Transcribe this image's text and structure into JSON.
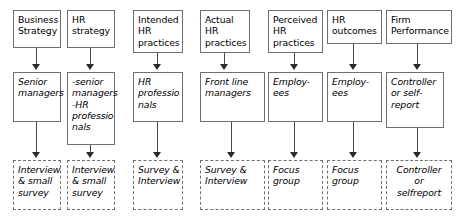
{
  "diagram": {
    "columns": [
      {
        "id": "business-strategy",
        "concept": "Business\nStrategy",
        "respondent": "Senior\nmanagers",
        "method": "Interview\n& small\nsurvey"
      },
      {
        "id": "hr-strategy",
        "concept": "HR\nstrategy",
        "respondent": "-senior\nmanagers\n-HR\nprofessio\nnals",
        "method": "Interview\n& small\nsurvey"
      },
      {
        "id": "intended-hr-practices",
        "concept": "Intended\nHR\npractices",
        "respondent": "HR\nprofessio\nnals",
        "method": "Survey &\nInterview"
      },
      {
        "id": "actual-hr-practices",
        "concept": "Actual\nHR\npractices",
        "respondent": "Front line\nmanagers",
        "method": "Survey &\nInterview"
      },
      {
        "id": "perceived-hr-practices",
        "concept": "Perceived\nHR\npractices",
        "respondent": "Employ-\nees",
        "method": "Focus\ngroup"
      },
      {
        "id": "hr-outcomes",
        "concept": "HR\noutcomes",
        "respondent": "Employ-\nees",
        "method": "Focus\ngroup"
      },
      {
        "id": "firm-performance",
        "concept": "Firm\nPerformance",
        "respondent": "Controller\nor self-\nreport",
        "method": "Controller\nor\nselfreport"
      }
    ],
    "colors": {
      "box_border": "#6f6f6f",
      "dashed_border": "#707070",
      "arrow": "#2b2b2b",
      "text": "#000000",
      "background": "#ffffff"
    }
  }
}
